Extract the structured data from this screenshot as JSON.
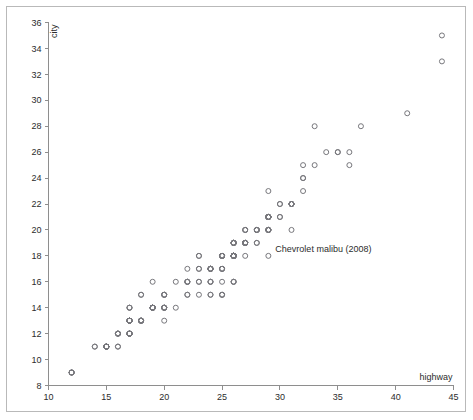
{
  "figure": {
    "frame_color": "#b9b9b9",
    "background": "#ffffff",
    "point_color": "#77777c",
    "axis_color": "#8e8e8e",
    "text_color": "#2c2c2c"
  },
  "chart_data": {
    "type": "scatter",
    "title": "",
    "xlabel": "highway",
    "ylabel": "city",
    "xlim": [
      10,
      45
    ],
    "ylim": [
      8,
      36
    ],
    "xticks": [
      10,
      15,
      20,
      25,
      30,
      35,
      40,
      45
    ],
    "xtick_labels": [
      "10",
      "15",
      "20",
      "25",
      "30",
      "35",
      "40",
      "45"
    ],
    "yticks": [
      8,
      10,
      12,
      14,
      16,
      18,
      20,
      22,
      24,
      26,
      28,
      30,
      32,
      34,
      36
    ],
    "ytick_labels": [
      "8",
      "10",
      "12",
      "14",
      "16",
      "18",
      "20",
      "22",
      "24",
      "26",
      "28",
      "30",
      "32",
      "34",
      "36"
    ],
    "grid": false,
    "legend": null,
    "marker": "open-circle",
    "marker_size": 5,
    "xlabel_position": "axis-end-right",
    "ylabel_position": "axis-end-top",
    "annotations": [
      {
        "text": "Chevrolet malibu (2008)",
        "x": 29,
        "y": 18.5,
        "anchor": "left",
        "offset_px": [
          7,
          3
        ]
      }
    ],
    "x": [
      29,
      29,
      31,
      30,
      26,
      26,
      27,
      26,
      25,
      28,
      27,
      25,
      25,
      25,
      25,
      24,
      25,
      23,
      20,
      15,
      20,
      17,
      17,
      26,
      23,
      26,
      25,
      24,
      19,
      14,
      15,
      17,
      27,
      30,
      26,
      29,
      26,
      24,
      24,
      22,
      22,
      24,
      24,
      17,
      22,
      21,
      23,
      23,
      19,
      18,
      17,
      17,
      19,
      19,
      12,
      17,
      15,
      17,
      17,
      12,
      17,
      16,
      18,
      15,
      16,
      12,
      17,
      17,
      16,
      12,
      15,
      16,
      17,
      15,
      17,
      17,
      18,
      17,
      19,
      17,
      19,
      19,
      17,
      17,
      17,
      16,
      16,
      17,
      15,
      17,
      26,
      25,
      26,
      24,
      21,
      22,
      23,
      22,
      20,
      33,
      32,
      32,
      29,
      32,
      34,
      36,
      36,
      29,
      26,
      27,
      30,
      31,
      26,
      26,
      28,
      26,
      29,
      28,
      27,
      24,
      24,
      24,
      22,
      19,
      20,
      17,
      12,
      19,
      18,
      14,
      15,
      18,
      18,
      15,
      17,
      16,
      18,
      17,
      19,
      19,
      17,
      29,
      27,
      31,
      32,
      27,
      26,
      26,
      25,
      25,
      17,
      17,
      20,
      18,
      26,
      26,
      27,
      28,
      25,
      25,
      24,
      27,
      25,
      26,
      23,
      26,
      26,
      26,
      26,
      25,
      27,
      25,
      27,
      20,
      20,
      19,
      17,
      20,
      17,
      29,
      27,
      31,
      31,
      26,
      26,
      28,
      27,
      29,
      31,
      31,
      26,
      26,
      27,
      30,
      33,
      35,
      37,
      35,
      15,
      18,
      20,
      20,
      22,
      17,
      19,
      18,
      20,
      29,
      26,
      29,
      29,
      24,
      44,
      29,
      26,
      29,
      29,
      29,
      29,
      23,
      24,
      44,
      41,
      29,
      26,
      28,
      29,
      29,
      29,
      28,
      29,
      26,
      26,
      26
    ],
    "y": [
      18,
      21,
      20,
      21,
      16,
      18,
      18,
      18,
      16,
      20,
      19,
      15,
      17,
      17,
      15,
      15,
      17,
      16,
      14,
      11,
      14,
      13,
      12,
      16,
      15,
      16,
      15,
      15,
      14,
      11,
      11,
      12,
      19,
      22,
      18,
      20,
      18,
      17,
      16,
      16,
      15,
      17,
      17,
      12,
      17,
      16,
      18,
      18,
      16,
      15,
      14,
      14,
      14,
      14,
      9,
      13,
      11,
      13,
      13,
      9,
      13,
      11,
      13,
      11,
      12,
      9,
      13,
      13,
      12,
      9,
      11,
      11,
      13,
      11,
      12,
      14,
      15,
      13,
      14,
      13,
      14,
      14,
      13,
      13,
      13,
      12,
      12,
      13,
      11,
      13,
      18,
      17,
      18,
      16,
      14,
      16,
      17,
      15,
      13,
      28,
      24,
      25,
      23,
      24,
      26,
      25,
      26,
      21,
      18,
      19,
      21,
      22,
      18,
      18,
      20,
      18,
      20,
      20,
      19,
      17,
      16,
      17,
      16,
      14,
      15,
      12,
      9,
      14,
      13,
      11,
      11,
      13,
      13,
      11,
      12,
      12,
      13,
      12,
      14,
      14,
      12,
      21,
      19,
      22,
      23,
      19,
      18,
      18,
      18,
      18,
      12,
      12,
      15,
      13,
      19,
      19,
      20,
      20,
      18,
      18,
      17,
      19,
      18,
      19,
      17,
      19,
      19,
      18,
      18,
      18,
      19,
      18,
      19,
      14,
      14,
      14,
      12,
      15,
      12,
      21,
      20,
      22,
      22,
      19,
      19,
      20,
      19,
      21,
      22,
      22,
      19,
      19,
      20,
      22,
      25,
      26,
      28,
      26,
      11,
      13,
      14,
      14,
      16,
      12,
      14,
      13,
      15,
      21,
      18,
      21,
      21,
      17,
      35,
      20,
      18,
      20,
      21,
      21,
      21,
      16,
      17,
      33,
      29,
      20,
      18,
      19,
      20,
      20,
      21,
      19,
      21,
      18,
      18,
      18
    ]
  }
}
